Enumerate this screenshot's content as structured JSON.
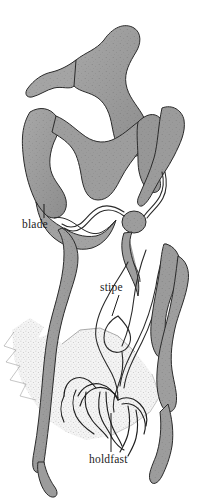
{
  "figure": {
    "background_color": "#ffffff",
    "ink_color": "#1b1b1b",
    "fill_color": "#9a9a9a",
    "fill_dark": "#868686",
    "fill_light": "#b4b4b4",
    "stipple_color": "#6e6e6e",
    "rock_fill": "#f2f2f2"
  },
  "labels": [
    {
      "id": "blade",
      "text": "blade",
      "text_x": 22,
      "text_y": 228,
      "leader": {
        "x1": 44,
        "y1": 204,
        "x2": 44,
        "y2": 218
      }
    },
    {
      "id": "stipe",
      "text": "stipe",
      "text_x": 100,
      "text_y": 291,
      "leader": {
        "x1": 119,
        "y1": 295,
        "x2": 112,
        "y2": 316
      }
    },
    {
      "id": "holdfast",
      "text": "holdfast",
      "text_x": 89,
      "text_y": 463,
      "leader": {
        "x1": 111,
        "y1": 413,
        "x2": 111,
        "y2": 452
      }
    }
  ],
  "parts": {
    "blade_label": "blade",
    "stipe_label": "stipe",
    "holdfast_label": "holdfast"
  }
}
